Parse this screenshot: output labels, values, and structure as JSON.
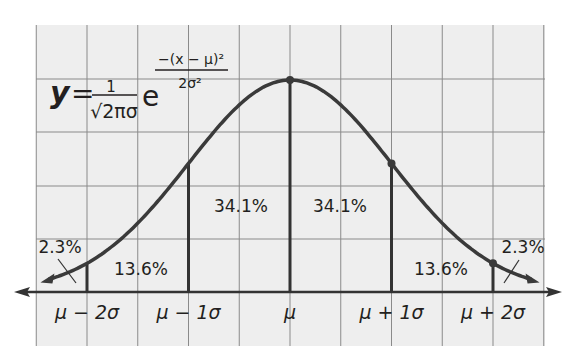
{
  "chart_data": {
    "type": "area",
    "title": "",
    "formula": {
      "lhs": "y",
      "equals": "=",
      "numerator": "1",
      "denominator": "√2πσ",
      "base": "e",
      "exp_numerator": "−(x − μ)²",
      "exp_denominator": "2σ²"
    },
    "x_domain_sigma": [
      -2.5,
      2.5
    ],
    "x_ticks": [
      {
        "sigma": -2,
        "label": "μ − 2σ"
      },
      {
        "sigma": -1,
        "label": "μ − 1σ"
      },
      {
        "sigma": 0,
        "label": "μ"
      },
      {
        "sigma": 1,
        "label": "μ + 1σ"
      },
      {
        "sigma": 2,
        "label": "μ + 2σ"
      }
    ],
    "regions": [
      {
        "from": -3,
        "to": -2,
        "value": 2.3,
        "label": "2.3%"
      },
      {
        "from": -2,
        "to": -1,
        "value": 13.6,
        "label": "13.6%"
      },
      {
        "from": -1,
        "to": 0,
        "value": 34.1,
        "label": "34.1%"
      },
      {
        "from": 0,
        "to": 1,
        "value": 34.1,
        "label": "34.1%"
      },
      {
        "from": 1,
        "to": 2,
        "value": 13.6,
        "label": "13.6%"
      },
      {
        "from": 2,
        "to": 3,
        "value": 2.3,
        "label": "2.3%"
      }
    ],
    "highlighted_points_sigma": [
      0,
      1,
      2
    ],
    "grid": true,
    "legend": "none",
    "colors": {
      "background": "#eeeeee",
      "grid": "#8a8a8a",
      "curve": "#3a3a3a",
      "text": "#231f20"
    }
  }
}
